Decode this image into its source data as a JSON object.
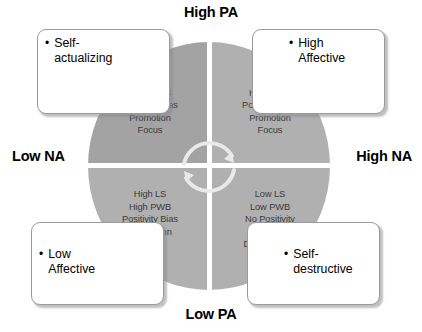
{
  "axes": {
    "top": "High PA",
    "bottom": "Low PA",
    "left": "Low NA",
    "right": "High NA"
  },
  "quadrants": {
    "top_left": {
      "name": "high-pa-low-na",
      "attributes": "High LS\nHigh PWB\nPositivity Bias\nPromotion\nFocus",
      "fill": "#a3a3a3"
    },
    "top_right": {
      "name": "high-pa-high-na",
      "attributes": "High LS\nHigh PWB\nPositivity Bias\nPromotion\nFocus",
      "fill": "#b0b0b0"
    },
    "bottom_left": {
      "name": "low-pa-low-na",
      "attributes": "High LS\nHigh PWB\nPositivity Bias\nPrevention\nFocus",
      "fill": "#b0b0b0"
    },
    "bottom_right": {
      "name": "low-pa-high-na",
      "attributes": "Low LS\nLow PWB\nNo Positivity\nBias\nDisorganized",
      "fill": "#b0b0b0"
    }
  },
  "callouts": {
    "top_left": {
      "bullet": "•",
      "label": "Self-\nactualizing"
    },
    "top_right": {
      "bullet": "•",
      "label": "High\nAffective"
    },
    "bottom_left": {
      "bullet": "•",
      "label": "Low\nAffective"
    },
    "bottom_right": {
      "bullet": "•",
      "label": "Self-\ndestructive"
    }
  },
  "center": {
    "icon": "cyclical-arrows-icon",
    "stroke": "#e8e8e8"
  }
}
